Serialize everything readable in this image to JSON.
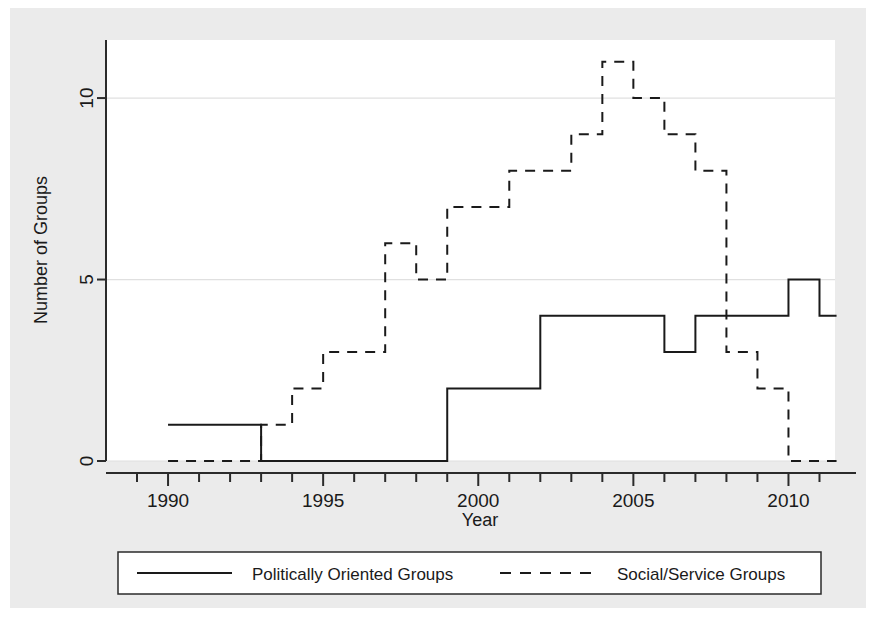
{
  "figure": {
    "background_color": "#ebebeb",
    "plot_background_color": "#ffffff",
    "axis_color": "#2b2b2b",
    "grid_color": "#e0e0e0",
    "series_color": "#1a1a1a"
  },
  "axes": {
    "x_title": "Year",
    "y_title": "Number of Groups",
    "x_ticks": [
      "1990",
      "1995",
      "2000",
      "2005",
      "2010"
    ],
    "y_ticks": [
      "0",
      "5",
      "10"
    ]
  },
  "legend": {
    "items": [
      {
        "label": "Politically Oriented Groups",
        "style": "solid"
      },
      {
        "label": "Social/Service Groups",
        "style": "dashed"
      }
    ]
  },
  "chart_data": {
    "type": "line",
    "title": "",
    "xlabel": "Year",
    "ylabel": "Number of Groups",
    "xlim": [
      1988,
      2011.5
    ],
    "ylim": [
      0,
      11.6
    ],
    "x_ticks": [
      1990,
      1995,
      2000,
      2005,
      2010
    ],
    "y_ticks": [
      0,
      5,
      10
    ],
    "grid": true,
    "grid_axis": "y",
    "line_shape": "step-post",
    "legend_position": "below-axes",
    "x": [
      1990,
      1991,
      1992,
      1993,
      1994,
      1995,
      1996,
      1997,
      1998,
      1999,
      2000,
      2001,
      2002,
      2003,
      2004,
      2005,
      2006,
      2007,
      2008,
      2009,
      2010,
      2011
    ],
    "series": [
      {
        "name": "Politically Oriented Groups",
        "style": "solid",
        "values": [
          1,
          1,
          1,
          0,
          0,
          0,
          0,
          0,
          0,
          2,
          2,
          2,
          4,
          4,
          4,
          4,
          3,
          4,
          4,
          4,
          5,
          4
        ]
      },
      {
        "name": "Social/Service Groups",
        "style": "dashed",
        "values": [
          0,
          0,
          0,
          1,
          2,
          3,
          3,
          6,
          5,
          7,
          7,
          8,
          8,
          9,
          11,
          10,
          9,
          8,
          3,
          2,
          0,
          0
        ]
      }
    ]
  }
}
